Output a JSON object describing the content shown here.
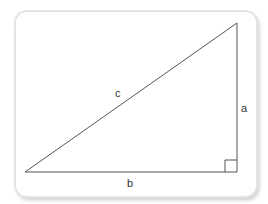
{
  "diagram": {
    "type": "right-triangle",
    "labels": {
      "hypotenuse": "c",
      "vertical_leg": "a",
      "horizontal_leg": "b"
    },
    "vertices": {
      "left": [
        25,
        172
      ],
      "top_right": [
        237,
        23
      ],
      "bottom_right": [
        237,
        172
      ]
    },
    "right_angle_marker": {
      "corner": "bottom-right",
      "size": 12
    },
    "colors": {
      "line": "#555555",
      "text": "#333333",
      "card_background": "#ffffff",
      "card_border": "#e4e4e4"
    }
  }
}
